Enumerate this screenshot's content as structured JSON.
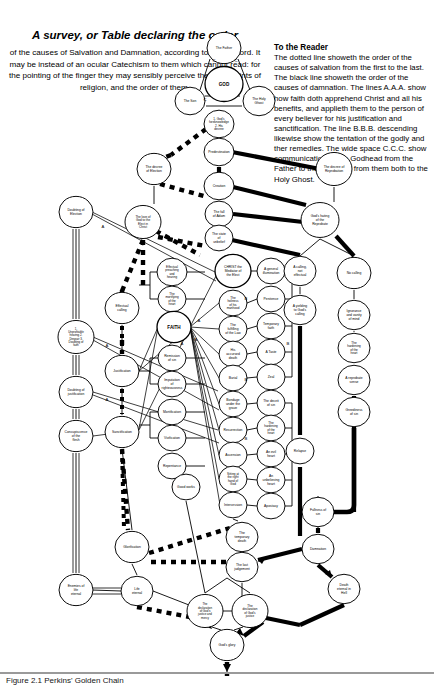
{
  "header": {
    "title": "A survey, or Table declaring the order",
    "subtitle": "of the causes of Salvation and Damnation, according to God's word. It may be instead of an ocular Catechism to them which cannot read: for the pointing of the finger they may sensibly perceive the chief points of religion, and the order of them.",
    "reader_heading": "To the Reader",
    "reader_body": "The dotted line showeth the order of the causes of salvation from the first to the last. The black line showeth the order of the causes of damnation. The lines A.A.A. show how faith doth apprehend Christ and all his benefits, and applieth them to the person of every believer for his justification and sanctification. The line B.B.B. descending likewise show the tentation of the godly and ther remedies. The wide space C.C.C. show communication of the Godhead from the Father to the Son, and from them both to the Holy Ghost."
  },
  "footer": {
    "caption": "Figure 2.1 Perkins' Golden Chain"
  },
  "colors": {
    "ink": "#000000",
    "paper": "#ffffff",
    "rule": "#9a9a9a"
  },
  "legend_marks": {
    "a": "A",
    "b": "B",
    "c": "C"
  },
  "chart_data": {
    "type": "diagram",
    "title": "A survey, or Table declaring the order",
    "node_count": 56,
    "nodes": [
      {
        "id": "father",
        "label": "The Father",
        "cx": 224,
        "cy": 48,
        "r": 17,
        "col": "godhead"
      },
      {
        "id": "god",
        "label": "GOD",
        "cx": 224,
        "cy": 84,
        "r": 19,
        "col": "godhead"
      },
      {
        "id": "son",
        "label": "The Son",
        "cx": 190,
        "cy": 101,
        "r": 15,
        "col": "godhead"
      },
      {
        "id": "holyghost",
        "label": "The Holy Ghost",
        "cx": 259,
        "cy": 101,
        "r": 16,
        "col": "godhead"
      },
      {
        "id": "foreknow",
        "label": "1. God's foreknowledge 2. His decree",
        "cx": 219,
        "cy": 124,
        "r": 15,
        "col": "centre"
      },
      {
        "id": "predestination",
        "label": "Predestination",
        "cx": 219,
        "cy": 152,
        "r": 15,
        "col": "centre"
      },
      {
        "id": "decree-elect",
        "label": "The decree of Election",
        "cx": 154,
        "cy": 169,
        "r": 17,
        "col": "elect"
      },
      {
        "id": "decree-repro",
        "label": "The decree of Reprobation",
        "cx": 334,
        "cy": 169,
        "r": 18,
        "col": "reprobate"
      },
      {
        "id": "creation",
        "label": "Creation",
        "cx": 219,
        "cy": 186,
        "r": 15,
        "col": "centre"
      },
      {
        "id": "love-elect",
        "label": "The love of God to the Elect in Christ",
        "cx": 143,
        "cy": 222,
        "r": 18,
        "col": "elect"
      },
      {
        "id": "hating-repro",
        "label": "God's hating of the Reprobate",
        "cx": 320,
        "cy": 220,
        "r": 19,
        "col": "reprobate"
      },
      {
        "id": "fall-adam",
        "label": "The fall of Adam",
        "cx": 219,
        "cy": 214,
        "r": 14,
        "col": "centre"
      },
      {
        "id": "state-unbelief",
        "label": "The state of unbelief",
        "cx": 219,
        "cy": 238,
        "r": 14,
        "col": "centre"
      },
      {
        "id": "doubt-election",
        "label": "Doubting of Election",
        "cx": 76,
        "cy": 212,
        "r": 17,
        "col": "tentation"
      },
      {
        "id": "effectual-call",
        "label": "Effectual calling",
        "cx": 122,
        "cy": 308,
        "r": 17,
        "col": "benefit"
      },
      {
        "id": "eff-preach",
        "label": "Effectual preaching and hearing",
        "cx": 172,
        "cy": 272,
        "r": 15,
        "col": "means"
      },
      {
        "id": "mortify-heart",
        "label": "The mortifying of the heart",
        "cx": 172,
        "cy": 299,
        "r": 14,
        "col": "means"
      },
      {
        "id": "faith",
        "label": "FAITH",
        "cx": 174,
        "cy": 327,
        "r": 17,
        "col": "means"
      },
      {
        "id": "remission",
        "label": "Remission of sin",
        "cx": 172,
        "cy": 358,
        "r": 14,
        "col": "means"
      },
      {
        "id": "imputation",
        "label": "Imputation of righteousness",
        "cx": 172,
        "cy": 384,
        "r": 14,
        "col": "means"
      },
      {
        "id": "mortification",
        "label": "Mortification",
        "cx": 172,
        "cy": 412,
        "r": 14,
        "col": "means"
      },
      {
        "id": "vivification",
        "label": "Vivification",
        "cx": 172,
        "cy": 438,
        "r": 14,
        "col": "means"
      },
      {
        "id": "repentance",
        "label": "Repentance",
        "cx": 172,
        "cy": 466,
        "r": 14,
        "col": "means"
      },
      {
        "id": "good-works",
        "label": "Good works",
        "cx": 186,
        "cy": 487,
        "r": 14,
        "col": "means"
      },
      {
        "id": "justification",
        "label": "Justification",
        "cx": 122,
        "cy": 371,
        "r": 17,
        "col": "benefit"
      },
      {
        "id": "sanctification",
        "label": "Sanctification",
        "cx": 122,
        "cy": 432,
        "r": 17,
        "col": "benefit"
      },
      {
        "id": "unprofitable",
        "label": "1. Unprofitable hearing 2. Despair 3. Doubting of faith",
        "cx": 76,
        "cy": 337,
        "r": 18,
        "col": "tentation"
      },
      {
        "id": "doubt-justif",
        "label": "Doubting of justification",
        "cx": 76,
        "cy": 392,
        "r": 17,
        "col": "tentation"
      },
      {
        "id": "concupiscence",
        "label": "Concupiscence of the flesh",
        "cx": 76,
        "cy": 436,
        "r": 17,
        "col": "tentation"
      },
      {
        "id": "christ",
        "label": "CHRIST the Mediator of the Elect",
        "cx": 233,
        "cy": 271,
        "r": 18,
        "col": "christ"
      },
      {
        "id": "holiness",
        "label": "The holiness of his manhood",
        "cx": 233,
        "cy": 303,
        "r": 14,
        "col": "christ"
      },
      {
        "id": "fulfil-law",
        "label": "The fulfilling of the Law",
        "cx": 233,
        "cy": 329,
        "r": 14,
        "col": "christ"
      },
      {
        "id": "accursed",
        "label": "His accursed death",
        "cx": 233,
        "cy": 354,
        "r": 14,
        "col": "christ"
      },
      {
        "id": "burial",
        "label": "Burial",
        "cx": 233,
        "cy": 378,
        "r": 14,
        "col": "christ"
      },
      {
        "id": "bondage",
        "label": "Bondage under the grave",
        "cx": 233,
        "cy": 404,
        "r": 14,
        "col": "christ"
      },
      {
        "id": "resurrection",
        "label": "Resurrection",
        "cx": 233,
        "cy": 430,
        "r": 14,
        "col": "christ"
      },
      {
        "id": "ascension",
        "label": "Ascension",
        "cx": 233,
        "cy": 455,
        "r": 14,
        "col": "christ"
      },
      {
        "id": "sitting",
        "label": "Sitting at the right hand of God",
        "cx": 233,
        "cy": 479,
        "r": 14,
        "col": "christ"
      },
      {
        "id": "intercession",
        "label": "Intercession",
        "cx": 233,
        "cy": 505,
        "r": 14,
        "col": "christ"
      },
      {
        "id": "illumination",
        "label": "A general illumination",
        "cx": 271,
        "cy": 271,
        "r": 14,
        "col": "repro-means"
      },
      {
        "id": "penitence",
        "label": "Penitence",
        "cx": 271,
        "cy": 299,
        "r": 14,
        "col": "repro-means"
      },
      {
        "id": "temp-faith",
        "label": "Temporary faith",
        "cx": 271,
        "cy": 326,
        "r": 14,
        "col": "repro-means"
      },
      {
        "id": "taste",
        "label": "A Taste",
        "cx": 271,
        "cy": 352,
        "r": 14,
        "col": "repro-means"
      },
      {
        "id": "zeal",
        "label": "Zeal",
        "cx": 271,
        "cy": 377,
        "r": 14,
        "col": "repro-means"
      },
      {
        "id": "deceit-sin",
        "label": "The deceit of sin",
        "cx": 271,
        "cy": 403,
        "r": 14,
        "col": "repro-means"
      },
      {
        "id": "harden-heart2",
        "label": "The hardening of the heart",
        "cx": 271,
        "cy": 428,
        "r": 14,
        "col": "repro-means"
      },
      {
        "id": "evil-heart",
        "label": "An evil heart",
        "cx": 271,
        "cy": 454,
        "r": 14,
        "col": "repro-means"
      },
      {
        "id": "unbelieving",
        "label": "An unbelieving heart",
        "cx": 271,
        "cy": 480,
        "r": 14,
        "col": "repro-means"
      },
      {
        "id": "apostasy",
        "label": "Apostasy",
        "cx": 271,
        "cy": 506,
        "r": 14,
        "col": "repro-means"
      },
      {
        "id": "calling-noteff",
        "label": "A calling, not effectual",
        "cx": 300,
        "cy": 271,
        "r": 16,
        "col": "repro-call"
      },
      {
        "id": "yielding",
        "label": "A yielding to God's calling",
        "cx": 300,
        "cy": 310,
        "r": 16,
        "col": "repro-call"
      },
      {
        "id": "relapse",
        "label": "Relapse",
        "cx": 300,
        "cy": 451,
        "r": 14,
        "col": "repro-call"
      },
      {
        "id": "no-calling",
        "label": "No calling",
        "cx": 354,
        "cy": 273,
        "r": 17,
        "col": "repro-none"
      },
      {
        "id": "ignorance",
        "label": "Ignorance and vanity of mind",
        "cx": 354,
        "cy": 315,
        "r": 16,
        "col": "repro-none"
      },
      {
        "id": "harden-heart",
        "label": "The hardening of the heart",
        "cx": 354,
        "cy": 348,
        "r": 16,
        "col": "repro-none"
      },
      {
        "id": "repro-sense",
        "label": "A reprobate sense",
        "cx": 354,
        "cy": 380,
        "r": 16,
        "col": "repro-none"
      },
      {
        "id": "greediness",
        "label": "Greediness of sin",
        "cx": 354,
        "cy": 412,
        "r": 16,
        "col": "repro-none"
      },
      {
        "id": "fullness",
        "label": "Fullness of sin",
        "cx": 318,
        "cy": 512,
        "r": 16,
        "col": "repro-none"
      },
      {
        "id": "glorification",
        "label": "Glorification",
        "cx": 132,
        "cy": 547,
        "r": 17,
        "col": "benefit"
      },
      {
        "id": "temp-death",
        "label": "The temporary death",
        "cx": 242,
        "cy": 537,
        "r": 16,
        "col": "christ"
      },
      {
        "id": "last-judge",
        "label": "The last judgement",
        "cx": 242,
        "cy": 567,
        "r": 16,
        "col": "christ"
      },
      {
        "id": "damnation",
        "label": "Damnation",
        "cx": 318,
        "cy": 549,
        "r": 16,
        "col": "repro-none"
      },
      {
        "id": "enemies",
        "label": "Enemies of life eternal",
        "cx": 76,
        "cy": 590,
        "r": 17,
        "col": "tentation"
      },
      {
        "id": "life-eternal",
        "label": "Life eternal",
        "cx": 137,
        "cy": 591,
        "r": 16,
        "col": "benefit"
      },
      {
        "id": "death-hell",
        "label": "Death eternal in Hell",
        "cx": 344,
        "cy": 589,
        "r": 16,
        "col": "repro-none"
      },
      {
        "id": "decl-mercy",
        "label": "The declaration of God's justice and mercy",
        "cx": 205,
        "cy": 611,
        "r": 18,
        "col": "centre"
      },
      {
        "id": "decl-justice",
        "label": "The declaration of God's justice",
        "cx": 250,
        "cy": 611,
        "r": 18,
        "col": "centre"
      },
      {
        "id": "gods-glory",
        "label": "God's glory",
        "cx": 227,
        "cy": 645,
        "r": 17,
        "col": "centre"
      }
    ]
  }
}
